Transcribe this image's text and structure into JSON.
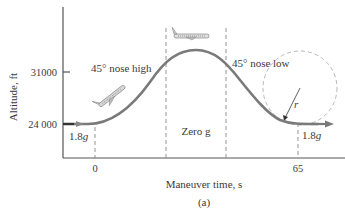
{
  "figure": {
    "caption": "(a)",
    "axes": {
      "ylabel": "Altitude, ft",
      "xlabel": "Maneuver time, s",
      "y_ticks": [
        "31000",
        "24 000"
      ],
      "x_ticks": [
        "0",
        "65"
      ]
    },
    "phase_labels": {
      "nose_high": "45° nose high",
      "zero_g": "Zero g",
      "nose_low": "45° nose low",
      "start_g": "1.8",
      "end_g": "1.8",
      "g_unit": "g"
    },
    "radius_label": "r",
    "colors": {
      "axis": "#555555",
      "curve": "#7a7a7a",
      "dashed": "#888888",
      "circle": "#b0b0b0",
      "text": "#3a3a3a"
    }
  }
}
